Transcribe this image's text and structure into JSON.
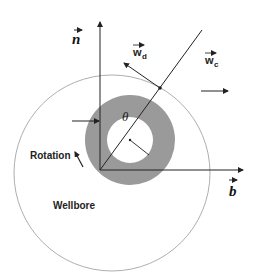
{
  "diagram": {
    "labels": {
      "n_vector": "n",
      "b_vector": "b",
      "w_d": "w",
      "w_d_sub": "d",
      "w_c": "w",
      "w_c_sub": "c",
      "theta": "θ",
      "rotation": "Rotation",
      "wellbore": "Wellbore"
    },
    "colors": {
      "annulus": "#9a9a9a",
      "line": "#222222",
      "wellbore_circle": "#888888",
      "background": "#ffffff"
    }
  }
}
